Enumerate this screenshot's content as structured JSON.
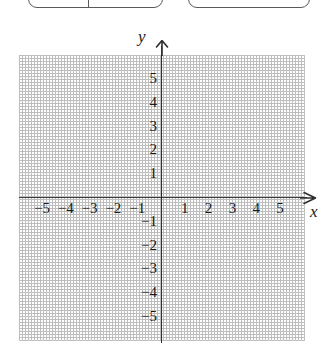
{
  "top_fragments": {
    "left_box_label": "",
    "right_box_label": ""
  },
  "chart_data": {
    "type": "scatter",
    "title": "",
    "xlabel": "x",
    "ylabel": "y",
    "xlim": [
      -6,
      6
    ],
    "ylim": [
      -6,
      6
    ],
    "grid": true,
    "grid_style": "dotted",
    "legend": "none",
    "series": [],
    "values": [],
    "x": [],
    "categories": [],
    "annotations": [],
    "x_ticks": [
      {
        "value": -5,
        "label": "−5"
      },
      {
        "value": -4,
        "label": "−4"
      },
      {
        "value": -3,
        "label": "−3"
      },
      {
        "value": -2,
        "label": "−2"
      },
      {
        "value": -1,
        "label": "−1"
      },
      {
        "value": 1,
        "label": "1"
      },
      {
        "value": 2,
        "label": "2"
      },
      {
        "value": 3,
        "label": "3"
      },
      {
        "value": 4,
        "label": "4"
      },
      {
        "value": 5,
        "label": "5"
      }
    ],
    "y_ticks": [
      {
        "value": 5,
        "label": "5"
      },
      {
        "value": 4,
        "label": "4"
      },
      {
        "value": 3,
        "label": "3"
      },
      {
        "value": 2,
        "label": "2"
      },
      {
        "value": 1,
        "label": "1"
      },
      {
        "value": -1,
        "label": "−1"
      },
      {
        "value": -2,
        "label": "−2"
      },
      {
        "value": -3,
        "label": "−3"
      },
      {
        "value": -4,
        "label": "−4"
      },
      {
        "value": -5,
        "label": "−5"
      }
    ],
    "colors": {
      "grid": "#c4c4c4",
      "axis": "#2e2e2e",
      "text": "#1a1a1a",
      "background": "#ffffff"
    }
  }
}
